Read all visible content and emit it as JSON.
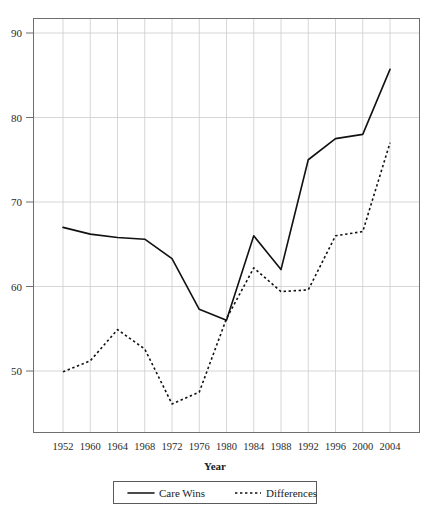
{
  "chart_data": {
    "type": "line",
    "title": "",
    "xlabel": "Year",
    "ylabel": "",
    "x": [
      1952,
      1960,
      1964,
      1968,
      1972,
      1976,
      1980,
      1984,
      1988,
      1992,
      1996,
      2000,
      2004
    ],
    "categories": [
      "1952",
      "1960",
      "1964",
      "1968",
      "1972",
      "1976",
      "1980",
      "1984",
      "1988",
      "1992",
      "1996",
      "2000",
      "2004"
    ],
    "series": [
      {
        "name": "Care Wins",
        "style": "solid",
        "values": [
          67.0,
          66.2,
          65.8,
          65.6,
          63.3,
          57.3,
          56.0,
          66.0,
          62.0,
          75.0,
          77.5,
          78.0,
          85.7
        ]
      },
      {
        "name": "Differences",
        "style": "dotted",
        "values": [
          49.9,
          51.2,
          54.9,
          52.6,
          46.1,
          47.5,
          56.2,
          62.2,
          59.4,
          59.6,
          66.0,
          66.5,
          77.0
        ]
      }
    ],
    "xlim": [
      1948,
      2008
    ],
    "ylim": [
      43.0,
      92.5
    ],
    "y_ticks": [
      50,
      60,
      70,
      80,
      90
    ],
    "y_tick_labels": [
      "50",
      "60",
      "70",
      "80",
      "90"
    ],
    "grid": {
      "x": true,
      "y": true
    },
    "legend": {
      "position": "below-axis",
      "entries": [
        {
          "label": "Care Wins",
          "style": "solid"
        },
        {
          "label": "Differences",
          "style": "dotted"
        }
      ]
    },
    "colors": {
      "line": "#111111",
      "grid": "#cccccc",
      "border": "#6e6e6e",
      "background": "#ffffff",
      "text": "#1a1a1a"
    }
  },
  "axis": {
    "x_title": "Year"
  }
}
